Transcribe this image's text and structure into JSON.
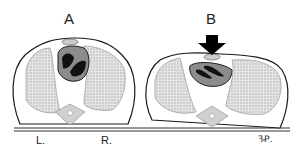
{
  "diagram": {
    "panels": [
      {
        "label": "A",
        "state": "uncompressed chest cross-section"
      },
      {
        "label": "B",
        "state": "compressed chest cross-section with downward force arrow"
      }
    ],
    "side_labels": {
      "left": "L.",
      "right": "R."
    },
    "signature": "ꟻꝒ.",
    "colors": {
      "outline": "#1a1a1a",
      "lung_fill": "#d8d8d8",
      "heart_fill": "#8c8c8c",
      "chamber_fill": "#111111",
      "spine_fill": "#d0d0d0",
      "arrow_fill": "#000000"
    }
  }
}
